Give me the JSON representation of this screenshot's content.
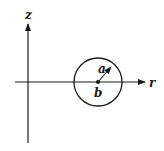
{
  "diagram": {
    "type": "coordinate-sketch",
    "axes": {
      "vertical_label": "z",
      "horizontal_label": "r"
    },
    "circle": {
      "center_label": "b",
      "radius_label": "a"
    },
    "colors": {
      "stroke": "#1a1a1a",
      "background": "#ffffff"
    }
  }
}
